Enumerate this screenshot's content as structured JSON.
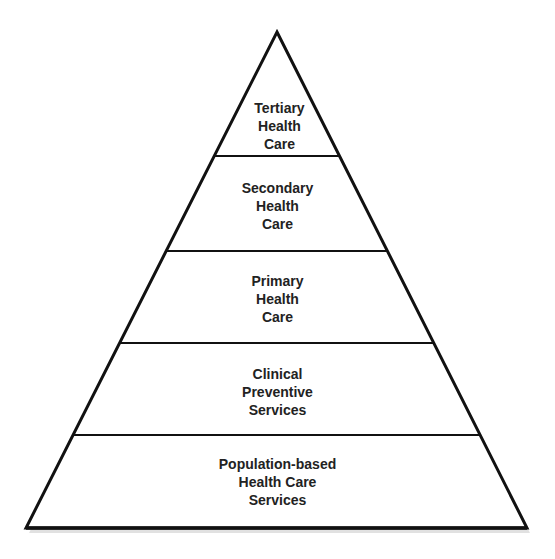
{
  "diagram": {
    "type": "pyramid",
    "colors": {
      "stroke": "#111111",
      "fill": "#ffffff",
      "text": "#222222",
      "shadow": "#c8c8c8"
    },
    "tiers": [
      {
        "level": 1,
        "lines": [
          "Tertiary",
          "Health",
          "Care"
        ]
      },
      {
        "level": 2,
        "lines": [
          "Secondary",
          "Health",
          "Care"
        ]
      },
      {
        "level": 3,
        "lines": [
          "Primary",
          "Health",
          "Care"
        ]
      },
      {
        "level": 4,
        "lines": [
          "Clinical",
          "Preventive",
          "Services"
        ]
      },
      {
        "level": 5,
        "lines": [
          "Population-based",
          "Health Care",
          "Services"
        ]
      }
    ]
  }
}
